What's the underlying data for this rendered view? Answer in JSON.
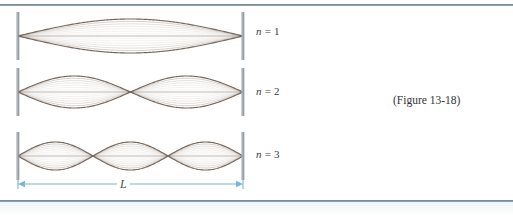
{
  "figure": {
    "caption": "(Figure 13-18)",
    "length_label": "L",
    "background_color": "#ffffff",
    "rule_color": "#6d7b8d",
    "string_color": "#6b5a4e",
    "string_faint_color": "#c9bfb6",
    "support_color": "#8a8f96",
    "dimension_color": "#7ab3d4"
  },
  "modes": [
    {
      "label_n": "n",
      "label_eq": "=",
      "label_value": "1",
      "harmonic": 1,
      "antinodes": 1,
      "label_x": 256,
      "label_y": 25,
      "center_y": 36,
      "amplitude": 17
    },
    {
      "label_n": "n",
      "label_eq": "=",
      "label_value": "2",
      "harmonic": 2,
      "antinodes": 2,
      "label_x": 256,
      "label_y": 85,
      "center_y": 92,
      "amplitude": 16
    },
    {
      "label_n": "n",
      "label_eq": "=",
      "label_value": "3",
      "harmonic": 3,
      "antinodes": 3,
      "label_x": 256,
      "label_y": 148,
      "center_y": 156,
      "amplitude": 14
    }
  ],
  "string_geometry": {
    "left_x": 18,
    "right_x": 243,
    "snapshot_count": 7
  },
  "dimension": {
    "y": 184,
    "left_x": 18,
    "right_x": 243
  }
}
